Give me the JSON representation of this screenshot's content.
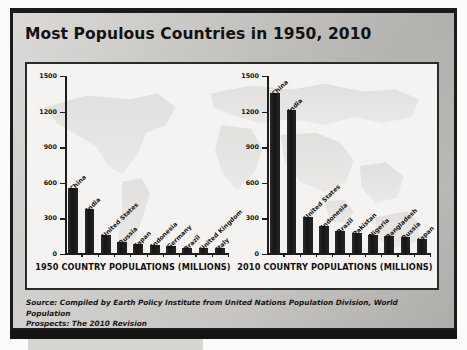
{
  "slide": {
    "title": "Most Populous Countries in 1950, 2010",
    "source_line1": "Source: Compiled by Earth Policy Institute from United Nations Population Division, World Population",
    "source_line2": "Prospects: The 2010 Revision",
    "colors": {
      "bar": "#1e1e1e",
      "slide_background": "#c9c7c4",
      "panel_background": "#f4f3f1",
      "frame": "#1b1b1b",
      "text": "#121212"
    }
  },
  "chart_data": [
    {
      "type": "bar",
      "title": "1950 COUNTRY POPULATIONS (MILLIONS)",
      "xlabel": "",
      "ylabel": "",
      "ylim": [
        0,
        1500
      ],
      "yticks": [
        0,
        300,
        600,
        900,
        1200,
        1500
      ],
      "grid": false,
      "legend": "none",
      "categories": [
        "China",
        "India",
        "United States",
        "Russia",
        "Japan",
        "Indonesia",
        "Germany",
        "Brazil",
        "United Kingdom",
        "Italy"
      ],
      "values": [
        554,
        376,
        158,
        103,
        82,
        73,
        68,
        54,
        51,
        47
      ]
    },
    {
      "type": "bar",
      "title": "2010 COUNTRY POPULATIONS (MILLIONS)",
      "xlabel": "",
      "ylabel": "",
      "ylim": [
        0,
        1500
      ],
      "yticks": [
        0,
        300,
        600,
        900,
        1200,
        1500
      ],
      "grid": false,
      "legend": "none",
      "categories": [
        "China",
        "India",
        "United States",
        "Indonesia",
        "Brazil",
        "Pakistan",
        "Nigeria",
        "Bangladesh",
        "Russia",
        "Japan"
      ],
      "values": [
        1354,
        1214,
        310,
        235,
        195,
        174,
        158,
        148,
        143,
        127
      ]
    }
  ]
}
